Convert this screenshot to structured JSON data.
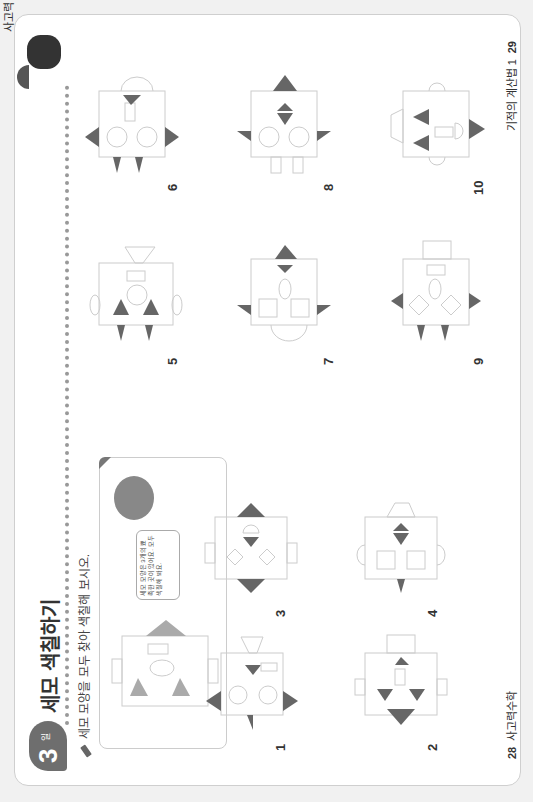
{
  "page": {
    "unit_badge": {
      "number": "3",
      "unit": "일"
    },
    "title": "세모 색칠하기",
    "instruction": "세모 모양을 모두 찾아 색칠해 보시오.",
    "example": {
      "bubble_text": "세모 모양은 3개의 뾰족한 곳이 있어요. 모두 색칠해 봐요."
    },
    "edge_text": "사고력",
    "problems": [
      {
        "number": "1"
      },
      {
        "number": "2"
      },
      {
        "number": "3"
      },
      {
        "number": "4"
      },
      {
        "number": "5"
      },
      {
        "number": "6"
      },
      {
        "number": "7"
      },
      {
        "number": "8"
      },
      {
        "number": "9"
      },
      {
        "number": "10"
      }
    ],
    "footer": {
      "left_page": "28",
      "left_label": "사고력수학",
      "right_label": "기적의 계산법 1",
      "right_page": "29"
    },
    "colors": {
      "shape_fill": "#666666",
      "outline": "#cccccc",
      "example_fill": "#aaaaaa"
    }
  }
}
